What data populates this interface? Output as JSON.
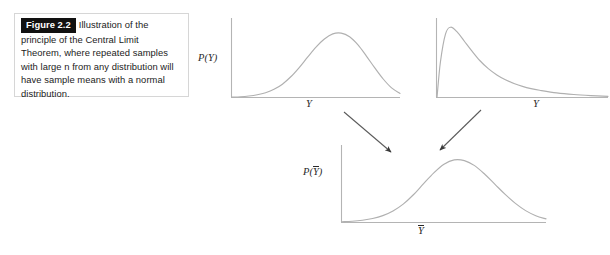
{
  "figure": {
    "tag": "Figure 2.2",
    "caption": "Illustration of the principle of the Central Limit Theorem, where repeated samples with large n from any distribution will have sample means with a normal distribution.",
    "colors": {
      "tag_background": "#111111",
      "tag_text": "#ffffff",
      "caption_text": "#1b1b1b",
      "caption_border": "#d6d6d6",
      "axis": "#b4b4b4",
      "curve": "#b0b0b0",
      "arrow": "#3a3a3a",
      "page_background": "#ffffff"
    }
  },
  "panels": [
    {
      "id": "top-left",
      "ylabel": "P(Y)",
      "xlabel": "Y",
      "ylabel_has_overbar": false,
      "xlabel_has_overbar": false
    },
    {
      "id": "top-right",
      "ylabel": "",
      "xlabel": "Y",
      "ylabel_has_overbar": false,
      "xlabel_has_overbar": false
    },
    {
      "id": "bottom",
      "ylabel": "P(Y)",
      "xlabel": "Y",
      "ylabel_has_overbar": true,
      "xlabel_has_overbar": true
    }
  ],
  "labels": {
    "py": {
      "pre": "P(",
      "var": "Y",
      "post": ")"
    },
    "y_top_left": "Y",
    "y_top_right": "Y",
    "pybar": {
      "pre": "P(",
      "var": "Y",
      "post": ")"
    },
    "ybar": "Y"
  },
  "arrows": [
    {
      "name": "arrow-from-normal-to-mean",
      "from": [
        344,
        112
      ],
      "to": [
        391,
        152
      ]
    },
    {
      "name": "arrow-from-skewed-to-mean",
      "from": [
        481,
        110
      ],
      "to": [
        440,
        150
      ]
    }
  ],
  "chart_data": [
    {
      "type": "line",
      "id": "top-left",
      "title": "",
      "xlabel": "Y",
      "ylabel": "P(Y)",
      "distribution": "normal",
      "grid": false,
      "legend": null,
      "axis_ticks": false,
      "xlim": [
        0,
        1
      ],
      "ylim": [
        0,
        1
      ],
      "x": [
        0.0,
        0.05,
        0.1,
        0.15,
        0.2,
        0.25,
        0.3,
        0.35,
        0.4,
        0.45,
        0.5,
        0.55,
        0.6,
        0.65,
        0.7,
        0.75,
        0.8,
        0.85,
        0.9,
        0.95,
        1.0
      ],
      "y": [
        0.005,
        0.01,
        0.02,
        0.037,
        0.065,
        0.11,
        0.18,
        0.28,
        0.405,
        0.545,
        0.68,
        0.79,
        0.86,
        0.87,
        0.82,
        0.71,
        0.56,
        0.4,
        0.25,
        0.13,
        0.055
      ]
    },
    {
      "type": "line",
      "id": "top-right",
      "title": "",
      "xlabel": "Y",
      "ylabel": "",
      "distribution": "right-skewed",
      "grid": false,
      "legend": null,
      "axis_ticks": false,
      "xlim": [
        0,
        1
      ],
      "ylim": [
        0,
        1
      ],
      "x": [
        0.0,
        0.02,
        0.05,
        0.08,
        0.12,
        0.16,
        0.2,
        0.25,
        0.3,
        0.35,
        0.4,
        0.45,
        0.5,
        0.55,
        0.6,
        0.7,
        0.8,
        0.9,
        1.0
      ],
      "y": [
        0.0,
        0.48,
        0.86,
        0.95,
        0.88,
        0.76,
        0.64,
        0.5,
        0.39,
        0.305,
        0.24,
        0.19,
        0.15,
        0.12,
        0.098,
        0.062,
        0.04,
        0.026,
        0.016
      ]
    },
    {
      "type": "line",
      "id": "bottom",
      "title": "",
      "xlabel": "Ȳ",
      "ylabel": "P(Ȳ)",
      "distribution": "normal",
      "grid": false,
      "legend": null,
      "axis_ticks": false,
      "xlim": [
        0,
        1
      ],
      "ylim": [
        0,
        1
      ],
      "x": [
        0.0,
        0.05,
        0.1,
        0.15,
        0.2,
        0.25,
        0.3,
        0.35,
        0.4,
        0.45,
        0.5,
        0.55,
        0.6,
        0.65,
        0.7,
        0.75,
        0.8,
        0.85,
        0.9,
        0.95,
        1.0
      ],
      "y": [
        0.01,
        0.018,
        0.032,
        0.055,
        0.095,
        0.16,
        0.255,
        0.385,
        0.54,
        0.69,
        0.81,
        0.87,
        0.86,
        0.79,
        0.67,
        0.53,
        0.39,
        0.265,
        0.165,
        0.095,
        0.05
      ]
    }
  ]
}
